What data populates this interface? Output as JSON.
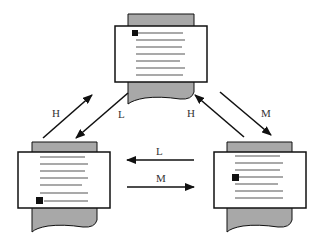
{
  "diagram": {
    "colors": {
      "stroke": "#111111",
      "paper_back": "#a8a8a8",
      "paper_front": "#ffffff",
      "line": "#555555"
    },
    "documents": [
      {
        "id": "top",
        "cursor_line": 0
      },
      {
        "id": "left",
        "cursor_line": 6
      },
      {
        "id": "right",
        "cursor_line": 3
      }
    ],
    "arrows": [
      {
        "from": "left",
        "to": "top",
        "label": "H"
      },
      {
        "from": "top",
        "to": "left",
        "label": "L"
      },
      {
        "from": "right",
        "to": "top",
        "label": "H"
      },
      {
        "from": "top",
        "to": "right",
        "label": "M"
      },
      {
        "from": "right",
        "to": "left",
        "label": "L"
      },
      {
        "from": "left",
        "to": "right",
        "label": "M"
      }
    ]
  }
}
